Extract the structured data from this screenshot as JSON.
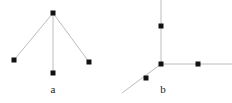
{
  "figure": {
    "background_color": "#ffffff",
    "edge_color": "#b4b4b4",
    "node_color": "#111111",
    "node_size": 5,
    "edge_width": 0.9,
    "width": 232,
    "height": 103,
    "panels": [
      {
        "id": "a",
        "label": "a",
        "label_x": 53,
        "label_y": 92,
        "description": "three-pointed star graph: apex node with three edges descending to left, center and right leaf nodes",
        "nodes": [
          {
            "name": "apex",
            "x": 53,
            "y": 13
          },
          {
            "name": "leaf-left",
            "x": 14,
            "y": 60
          },
          {
            "name": "leaf-center",
            "x": 53,
            "y": 73
          },
          {
            "name": "leaf-right",
            "x": 89,
            "y": 62
          }
        ],
        "edges": [
          {
            "from": "apex",
            "to": "leaf-left"
          },
          {
            "from": "apex",
            "to": "leaf-center"
          },
          {
            "from": "apex",
            "to": "leaf-right"
          }
        ]
      },
      {
        "id": "b",
        "label": "b",
        "label_x": 163,
        "label_y": 92,
        "description": "three rays meeting at a junction: one going up, one going right, one going down-left, each carrying a node",
        "nodes": [
          {
            "name": "junction",
            "x": 161,
            "y": 64
          },
          {
            "name": "node-up",
            "x": 161,
            "y": 26
          },
          {
            "name": "node-right",
            "x": 198,
            "y": 64
          },
          {
            "name": "node-lower-left",
            "x": 146,
            "y": 78
          }
        ],
        "rays": [
          {
            "name": "ray-up",
            "x1": 161,
            "y1": 64,
            "x2": 161,
            "y2": 0
          },
          {
            "name": "ray-right",
            "x1": 161,
            "y1": 64,
            "x2": 232,
            "y2": 64
          },
          {
            "name": "ray-lower-left",
            "x1": 161,
            "y1": 64,
            "x2": 122,
            "y2": 93
          }
        ]
      }
    ]
  }
}
